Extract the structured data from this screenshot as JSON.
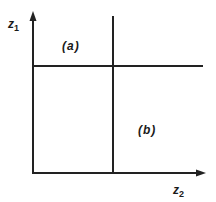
{
  "diagram": {
    "y_axis": {
      "label": "z",
      "subscript": "1"
    },
    "x_axis": {
      "label": "z",
      "subscript": "2"
    },
    "regions": [
      {
        "id": "a",
        "label": "(a)"
      },
      {
        "id": "b",
        "label": "(b)"
      }
    ],
    "line_color": "#222222"
  }
}
